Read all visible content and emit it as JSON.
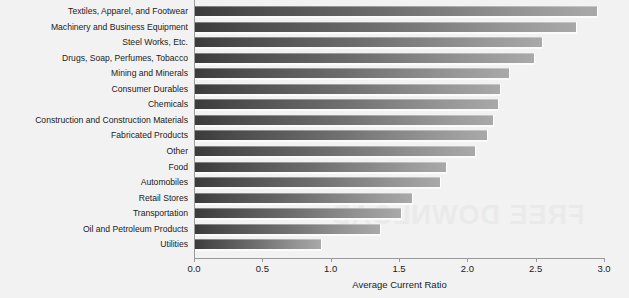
{
  "chart_data": {
    "type": "bar",
    "orientation": "horizontal",
    "title": "",
    "xlabel": "Average Current Ratio",
    "ylabel": "",
    "xlim": [
      0.0,
      3.0
    ],
    "xticks": [
      "0.0",
      "0.5",
      "1.0",
      "1.5",
      "2.0",
      "2.5",
      "3.0"
    ],
    "grid": false,
    "legend": false,
    "categories": [
      "Textiles, Apparel, and Footwear",
      "Machinery and Business Equipment",
      "Steel Works, Etc.",
      "Drugs, Soap, Perfumes, Tobacco",
      "Mining and Minerals",
      "Consumer Durables",
      "Chemicals",
      "Construction and Construction Materials",
      "Fabricated Products",
      "Other",
      "Food",
      "Automobiles",
      "Retail Stores",
      "Transportation",
      "Oil and Petroleum Products",
      "Utilities"
    ],
    "values": [
      2.94,
      2.79,
      2.54,
      2.48,
      2.3,
      2.23,
      2.22,
      2.18,
      2.14,
      2.05,
      1.84,
      1.79,
      1.59,
      1.51,
      1.35,
      0.92
    ]
  },
  "watermark": {
    "text": "FREE DOWNLOAD"
  },
  "colors": {
    "background": "#f2f2f2",
    "bar_dark": "#3b3b3b",
    "bar_light": "#a9a9a9",
    "axis": "#9a9a9a",
    "text": "#1b1b1b"
  }
}
